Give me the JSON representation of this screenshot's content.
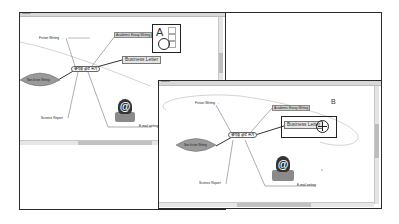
{
  "left_window": {
    "title": "Untitled",
    "mindmap": {
      "central": "생각을 글로 쓰기",
      "branches": [
        {
          "label": "Fiction Writing",
          "suffix": "→"
        },
        {
          "label": "Academic Essay Writing"
        },
        {
          "label": "Business Letter"
        },
        {
          "label": "Non-fiction Writing"
        },
        {
          "label": "Science Report"
        },
        {
          "label": "E-mail writing"
        }
      ]
    },
    "callout_label": "A"
  },
  "right_window": {
    "title": "Untitled",
    "mindmap": {
      "central": "생각을 글로 쓰기",
      "branches": [
        {
          "label": "Fiction Writing",
          "suffix": "→"
        },
        {
          "label": "Academic Essay Writing"
        },
        {
          "label": "Business Letter"
        },
        {
          "label": "Non-fiction Writing"
        },
        {
          "label": "Science Report"
        },
        {
          "label": "E-mail writing"
        }
      ]
    },
    "callout_label": "B"
  },
  "icons": {
    "email": "email-at-icon",
    "move_handle": "crosshair-move-icon",
    "resize_handles": "resize-handle-icon"
  }
}
